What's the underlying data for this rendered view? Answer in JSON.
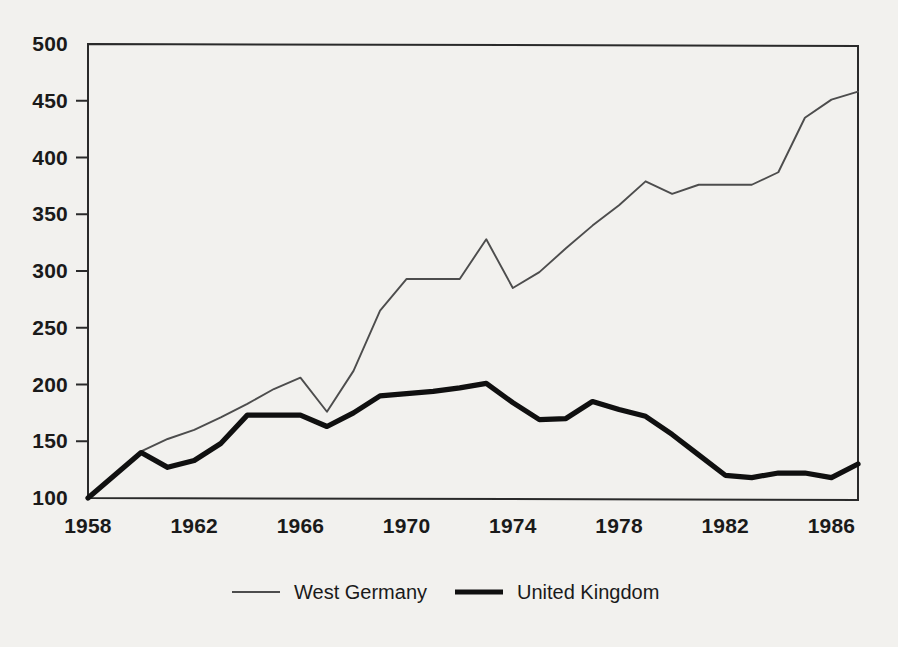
{
  "chart_data": {
    "type": "line",
    "title": "",
    "subtitle": "",
    "xlabel": "",
    "ylabel": "",
    "x": [
      1958,
      1959,
      1960,
      1961,
      1962,
      1963,
      1964,
      1965,
      1966,
      1967,
      1968,
      1969,
      1970,
      1971,
      1972,
      1973,
      1974,
      1975,
      1976,
      1977,
      1978,
      1979,
      1980,
      1981,
      1982,
      1983,
      1984,
      1985,
      1986,
      1987
    ],
    "xlim": [
      1958,
      1987
    ],
    "ylim": [
      100,
      500
    ],
    "xticks": [
      1958,
      1962,
      1966,
      1970,
      1974,
      1978,
      1982,
      1986
    ],
    "xtick_labels": [
      "1958",
      "1962",
      "1966",
      "1970",
      "1974",
      "1978",
      "1982",
      "1986"
    ],
    "yticks": [
      100,
      150,
      200,
      250,
      300,
      350,
      400,
      450,
      500
    ],
    "ytick_labels": [
      "100",
      "150",
      "200",
      "250",
      "300",
      "350",
      "400",
      "450",
      "500"
    ],
    "grid": false,
    "legend_position": "bottom",
    "series": [
      {
        "name": "West Germany",
        "line_style": "thin",
        "color": "#4d4d4d",
        "values": [
          100,
          120,
          141,
          152,
          160,
          171,
          183,
          196,
          206,
          176,
          212,
          265,
          293,
          293,
          293,
          328,
          285,
          299,
          320,
          340,
          358,
          379,
          368,
          376,
          376,
          376,
          387,
          435,
          451,
          458
        ]
      },
      {
        "name": "United Kingdom",
        "line_style": "thick",
        "color": "#101010",
        "values": [
          100,
          120,
          140,
          127,
          133,
          148,
          173,
          173,
          173,
          163,
          175,
          190,
          192,
          194,
          197,
          201,
          184,
          169,
          170,
          185,
          178,
          172,
          156,
          138,
          120,
          118,
          122,
          122,
          118,
          130
        ]
      }
    ],
    "legend": [
      {
        "label": "West Germany",
        "swatch": "thin-line-swatch"
      },
      {
        "label": "United Kingdom",
        "swatch": "thick-line-swatch"
      }
    ]
  }
}
